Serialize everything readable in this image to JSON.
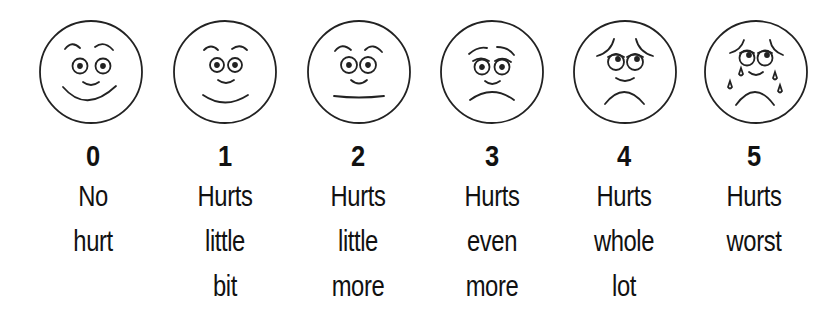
{
  "scale": {
    "name": "Wong-Baker FACES pain rating scale",
    "items": [
      {
        "score": "0",
        "lines": [
          "No",
          "hurt"
        ],
        "face": "smiling-face-icon"
      },
      {
        "score": "1",
        "lines": [
          "Hurts",
          "little",
          "bit"
        ],
        "face": "slight-smile-face-icon"
      },
      {
        "score": "2",
        "lines": [
          "Hurts",
          "little",
          "more"
        ],
        "face": "neutral-face-icon"
      },
      {
        "score": "3",
        "lines": [
          "Hurts",
          "even",
          "more"
        ],
        "face": "frowning-face-icon"
      },
      {
        "score": "4",
        "lines": [
          "Hurts",
          "whole",
          "lot"
        ],
        "face": "sad-face-icon"
      },
      {
        "score": "5",
        "lines": [
          "Hurts",
          "worst"
        ],
        "face": "crying-face-icon"
      }
    ]
  },
  "colors": {
    "ink": "#111111",
    "background": "#ffffff"
  }
}
